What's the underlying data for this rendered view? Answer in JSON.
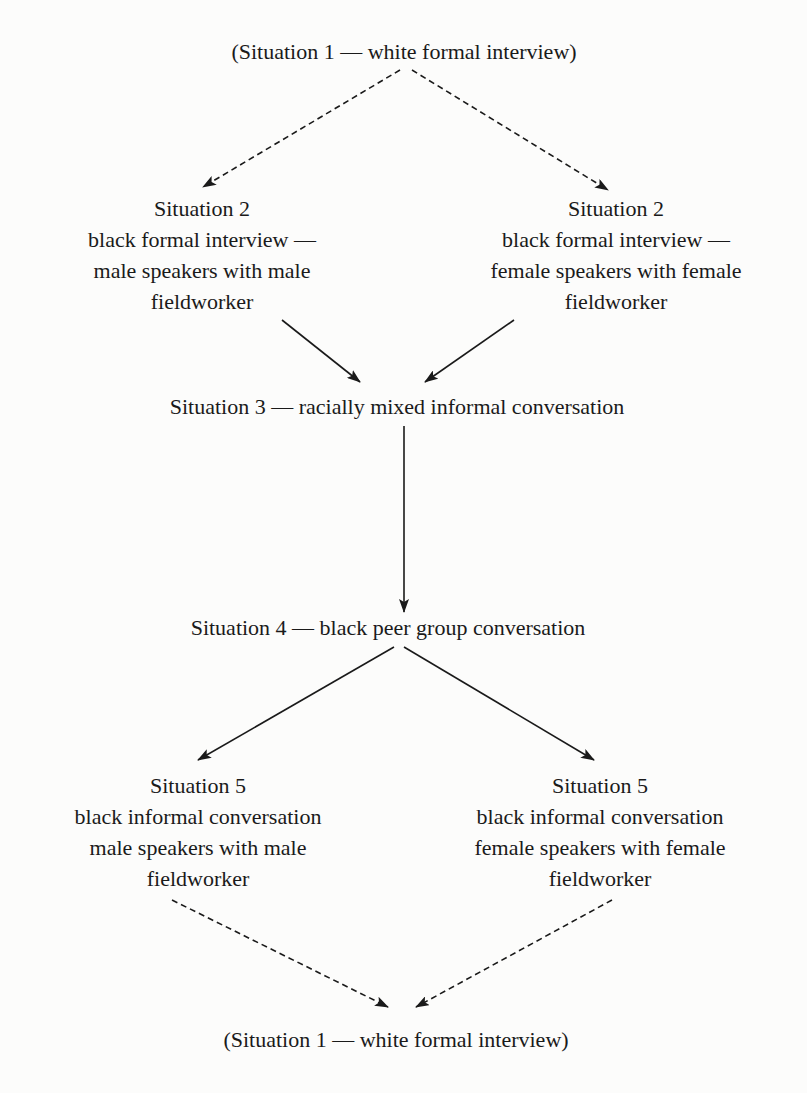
{
  "nodes": {
    "s1_top": {
      "text": "(Situation 1 — white formal interview)"
    },
    "s2_left": {
      "title": "Situation 2",
      "lines": [
        "black formal interview —",
        "male speakers with male",
        "fieldworker"
      ]
    },
    "s2_right": {
      "title": "Situation 2",
      "lines": [
        "black formal interview —",
        "female speakers with female",
        "fieldworker"
      ]
    },
    "s3": {
      "text": "Situation 3 — racially mixed informal conversation"
    },
    "s4": {
      "text": "Situation 4 — black peer group conversation"
    },
    "s5_left": {
      "title": "Situation 5",
      "lines": [
        "black informal conversation",
        "male speakers with male",
        "fieldworker"
      ]
    },
    "s5_right": {
      "title": "Situation 5",
      "lines": [
        "black informal conversation",
        "female speakers with female",
        "fieldworker"
      ]
    },
    "s1_bottom": {
      "text": "(Situation 1 — white formal interview)"
    }
  },
  "edges": [
    {
      "from": "s1_top",
      "to": "s2_left",
      "style": "dashed"
    },
    {
      "from": "s1_top",
      "to": "s2_right",
      "style": "dashed"
    },
    {
      "from": "s2_left",
      "to": "s3",
      "style": "solid"
    },
    {
      "from": "s2_right",
      "to": "s3",
      "style": "solid"
    },
    {
      "from": "s3",
      "to": "s4",
      "style": "solid"
    },
    {
      "from": "s4",
      "to": "s5_left",
      "style": "solid"
    },
    {
      "from": "s4",
      "to": "s5_right",
      "style": "solid"
    },
    {
      "from": "s5_left",
      "to": "s1_bottom",
      "style": "dashed"
    },
    {
      "from": "s5_right",
      "to": "s1_bottom",
      "style": "dashed"
    }
  ],
  "colors": {
    "ink": "#1a1a1a",
    "paper": "#fcfcfb"
  }
}
